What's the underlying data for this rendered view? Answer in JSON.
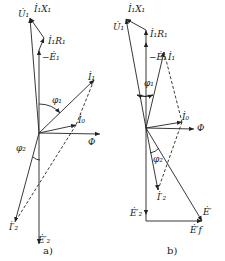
{
  "colors": {
    "ink": "#222222",
    "background": "#ffffff"
  },
  "diagrams": [
    {
      "caption": "a)",
      "labels": {
        "U1": "U̇₁",
        "I1X1": "İ₁X₁",
        "I1R1": "İ₁R₁",
        "negE1": "−Ė₁",
        "I1": "İ₁",
        "phi1": "φ₁",
        "I0": "İ₀",
        "Phi": "Φ",
        "phi2": "φ₂",
        "I2p": "İ′₂",
        "E2p": "Ė′₂"
      }
    },
    {
      "caption": "b)",
      "labels": {
        "U1": "U̇₁",
        "I1X1": "İ₁X₁",
        "I1R1": "İ₁R₁",
        "negE1": "−Ė₁",
        "I1": "İ₁",
        "phi1": "φ₁",
        "I0": "İ₀",
        "Phi": "Φ",
        "phi2": "φ₂",
        "I2p": "İ′₂",
        "E2p": "Ė′₂",
        "Ep": "Ė′",
        "Efp": "Ė′f"
      }
    }
  ]
}
